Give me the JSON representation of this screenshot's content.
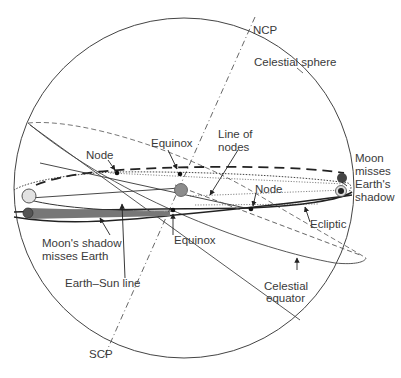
{
  "diagram": {
    "labels": {
      "ncp": "NCP",
      "scp": "SCP",
      "celestial_sphere": "Celestial sphere",
      "equinox_top": "Equinox",
      "equinox_bottom": "Equinox",
      "node_left": "Node",
      "node_right": "Node",
      "line_of_nodes_1": "Line of",
      "line_of_nodes_2": "nodes",
      "moon_misses_1": "Moon",
      "moon_misses_2": "misses",
      "moon_misses_3": "Earth's",
      "moon_misses_4": "shadow",
      "moon_shadow_1": "Moon's shadow",
      "moon_shadow_2": "misses Earth",
      "earth_sun_line": "Earth–Sun line",
      "ecliptic": "Ecliptic",
      "celestial_equator_1": "Celestial",
      "celestial_equator_2": "equator"
    },
    "colors": {
      "line": "#333333",
      "sun_fill": "#e2e2e2",
      "earth_fill": "#8c8c8c",
      "moon_fill": "#555555",
      "shadow_band": "#777777"
    }
  }
}
